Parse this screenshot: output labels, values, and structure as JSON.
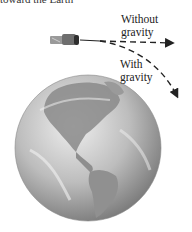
{
  "caption": {
    "text": "toward the Earth"
  },
  "labels": {
    "without_gravity": {
      "line1": "Without",
      "line2": "gravity"
    },
    "with_gravity": {
      "line1": "With",
      "line2": "gravity"
    }
  },
  "objects": {
    "projectile": "satellite",
    "planet": "Earth (Americas view)"
  },
  "colors": {
    "ink": "#222222",
    "earth_light": "#e6e6e6",
    "earth_mid": "#a8a8a8",
    "earth_dark": "#6a6a6a"
  }
}
